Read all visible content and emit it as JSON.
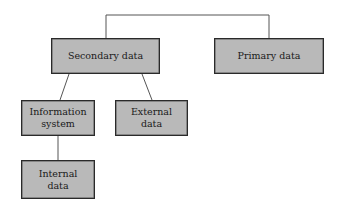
{
  "diagram": {
    "type": "hierarchy",
    "colors": {
      "box_fill": "#b9b9b9",
      "box_border": "#2a2a2a",
      "line": "#555555",
      "background": "#ffffff"
    },
    "nodes": {
      "secondary": {
        "label": "Secondary data"
      },
      "primary": {
        "label": "Primary data"
      },
      "information_system": {
        "label": "Information\nsystem"
      },
      "external": {
        "label": "External\ndata"
      },
      "internal": {
        "label": "Internal\ndata"
      }
    },
    "edges": [
      {
        "from": "root",
        "to": "secondary"
      },
      {
        "from": "root",
        "to": "primary"
      },
      {
        "from": "secondary",
        "to": "information_system"
      },
      {
        "from": "secondary",
        "to": "external"
      },
      {
        "from": "information_system",
        "to": "internal"
      }
    ]
  }
}
